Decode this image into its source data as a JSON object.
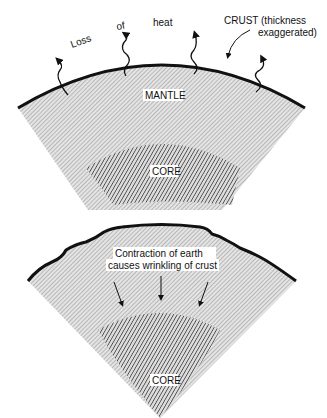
{
  "top_panel": {
    "heat_words": [
      "Loss",
      "of",
      "heat"
    ],
    "crust_label_line1": "CRUST (thickness",
    "crust_label_line2": "exaggerated)",
    "mantle_label": "MANTLE",
    "core_label": "CORE"
  },
  "bottom_panel": {
    "caption_line1": "Contraction of earth",
    "caption_line2": "causes wrinkling of crust",
    "core_label": "CORE"
  },
  "colors": {
    "crust": "#111111",
    "mantle_fill": "#cfcfcf",
    "core_hatch": "#555555"
  }
}
